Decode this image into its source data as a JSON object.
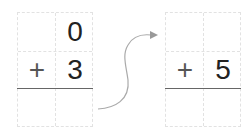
{
  "left_problem": {
    "rows": [
      [
        "",
        "0"
      ],
      [
        "+",
        "3"
      ],
      [
        "",
        ""
      ]
    ]
  },
  "right_problem": {
    "rows": [
      [
        "",
        ""
      ],
      [
        "+",
        "5"
      ],
      [
        "",
        ""
      ]
    ]
  },
  "arrow": {
    "color": "#aaaaaa"
  }
}
